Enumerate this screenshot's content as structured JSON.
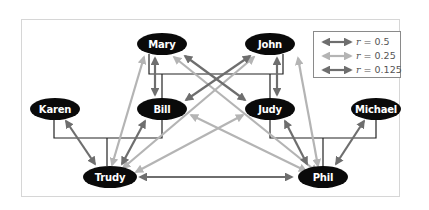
{
  "figure": {
    "type": "pedigree-relatedness-diagram",
    "nodes": [
      {
        "id": "mary",
        "label": "Mary"
      },
      {
        "id": "john",
        "label": "John"
      },
      {
        "id": "karen",
        "label": "Karen"
      },
      {
        "id": "bill",
        "label": "Bill"
      },
      {
        "id": "judy",
        "label": "Judy"
      },
      {
        "id": "michael",
        "label": "Michael"
      },
      {
        "id": "trudy",
        "label": "Trudy"
      },
      {
        "id": "phil",
        "label": "Phil"
      }
    ],
    "family_lines": [
      {
        "parents": [
          "Mary",
          "John"
        ],
        "children": [
          "Bill",
          "Judy"
        ]
      },
      {
        "parents": [
          "Karen",
          "Bill"
        ],
        "children": [
          "Trudy"
        ]
      },
      {
        "parents": [
          "Judy",
          "Michael"
        ],
        "children": [
          "Phil"
        ]
      }
    ],
    "relationships": [
      {
        "from": "Mary",
        "to": "Bill",
        "r": 0.5
      },
      {
        "from": "John",
        "to": "Judy",
        "r": 0.5
      },
      {
        "from": "Mary",
        "to": "Judy",
        "r": 0.5
      },
      {
        "from": "John",
        "to": "Bill",
        "r": 0.5
      },
      {
        "from": "Karen",
        "to": "Trudy",
        "r": 0.5
      },
      {
        "from": "Bill",
        "to": "Trudy",
        "r": 0.5
      },
      {
        "from": "Judy",
        "to": "Phil",
        "r": 0.5
      },
      {
        "from": "Michael",
        "to": "Phil",
        "r": 0.5
      },
      {
        "from": "Mary",
        "to": "Trudy",
        "r": 0.25
      },
      {
        "from": "John",
        "to": "Trudy",
        "r": 0.25
      },
      {
        "from": "Mary",
        "to": "Phil",
        "r": 0.25
      },
      {
        "from": "John",
        "to": "Phil",
        "r": 0.25
      },
      {
        "from": "Bill",
        "to": "Phil",
        "r": 0.25
      },
      {
        "from": "Judy",
        "to": "Trudy",
        "r": 0.25
      },
      {
        "from": "Trudy",
        "to": "Phil",
        "r": 0.125
      }
    ]
  },
  "legend": {
    "items": [
      {
        "symbol": "r",
        "value": "= 0.5",
        "color": "#6e6e6e"
      },
      {
        "symbol": "r",
        "value": "= 0.25",
        "color": "#b4b4b4"
      },
      {
        "symbol": "r",
        "value": "= 0.125",
        "color": "#6e6e6e"
      }
    ]
  },
  "colors": {
    "node_fill": "#0a0a0a",
    "node_text": "#ffffff",
    "line_dark": "#6e6e6e",
    "line_light": "#b4b4b4",
    "family_line": "#222222",
    "frame_border": "#d6d6d6"
  }
}
